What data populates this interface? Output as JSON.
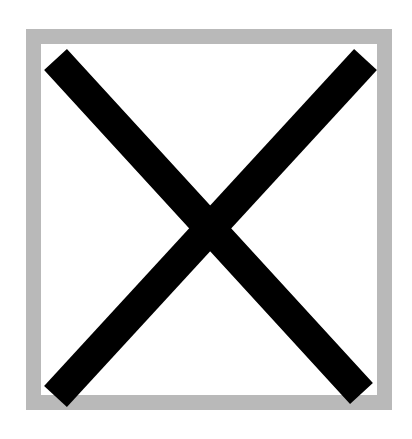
{
  "icon": {
    "name": "close-icon",
    "description": "Black X mark inside a gray square frame",
    "label": "Close",
    "colors": {
      "stroke": "#000000",
      "frame": "#b9b9b9",
      "background": "#ffffff"
    }
  }
}
